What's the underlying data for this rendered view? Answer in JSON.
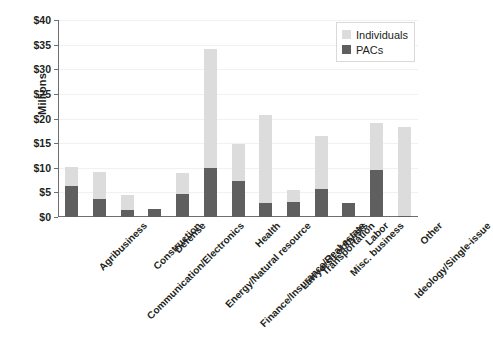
{
  "chart_data": {
    "type": "bar",
    "subtype": "stacked-vertical",
    "title": "",
    "xlabel": "",
    "ylabel": "Millions",
    "ylim": [
      0,
      40
    ],
    "ytick_step": 5,
    "ytick_labels": [
      "$0",
      "$5",
      "$10",
      "$15",
      "$20",
      "$25",
      "$30",
      "$35",
      "$40"
    ],
    "ytick_values": [
      0,
      5,
      10,
      15,
      20,
      25,
      30,
      35,
      40
    ],
    "grid": true,
    "grid_axis": "y",
    "legend_position": "top-right",
    "value_unit": "millions of dollars",
    "categories": [
      "Agribusiness",
      "Communication/Electronics",
      "Construction",
      "Defense",
      "Energy/Natural resource",
      "Finance/Insurance/Real estate",
      "Health",
      "Lawyers/Lobbyists",
      "Transportation",
      "Misc. business",
      "Labor",
      "Ideology/Single-issue",
      "Other"
    ],
    "series": [
      {
        "name": "PACs",
        "color": "#5f5f5f",
        "values": [
          6.3,
          3.7,
          1.5,
          1.7,
          4.7,
          10.0,
          7.3,
          2.8,
          3.1,
          5.6,
          2.9,
          9.5,
          0.3
        ]
      },
      {
        "name": "Individuals",
        "color": "#dcdcdc",
        "values": [
          3.9,
          5.5,
          3.0,
          0.0,
          4.2,
          24.2,
          7.6,
          17.9,
          2.3,
          10.9,
          0.0,
          9.5,
          17.9
        ]
      }
    ],
    "totals": [
      10.2,
      9.2,
      4.5,
      1.7,
      8.9,
      34.2,
      14.9,
      20.7,
      5.4,
      16.5,
      2.9,
      19.0,
      18.2
    ]
  },
  "legend": {
    "items": [
      {
        "label": "Individuals",
        "color": "#dcdcdc"
      },
      {
        "label": "PACs",
        "color": "#5f5f5f"
      }
    ]
  }
}
